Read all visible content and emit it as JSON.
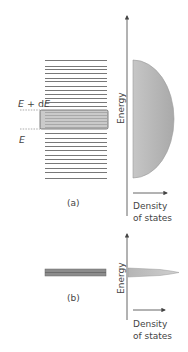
{
  "panel_a": {
    "label": "(a)",
    "upper_energy_label": "E + dE",
    "lower_energy_label": "E",
    "axis_label_y": "Energy",
    "axis_label_x_line1": "Density",
    "axis_label_x_line2": "of states",
    "energy_levels_y": [
      60,
      66,
      69,
      73,
      78,
      81,
      86,
      90,
      94,
      98,
      102,
      106,
      112,
      115,
      118,
      121,
      124,
      127,
      133,
      138,
      142,
      146,
      150,
      155,
      159,
      163,
      168,
      172,
      178
    ],
    "highlight_band": {
      "y_top": 110,
      "y_bottom": 129
    },
    "dos_shape": "semi-ellipse"
  },
  "panel_b": {
    "label": "(b)",
    "axis_label_y": "Energy",
    "axis_label_x_line1": "Density",
    "axis_label_x_line2": "of states",
    "dos_shape": "narrow spike"
  },
  "colors": {
    "line": "#555555",
    "band_fill": "#b8b8b8",
    "band_border": "#606060",
    "dos_fill": "#bdbdbd",
    "dos_edge": "#9a9a9a",
    "axis": "#555555",
    "dashed": "#888888"
  }
}
